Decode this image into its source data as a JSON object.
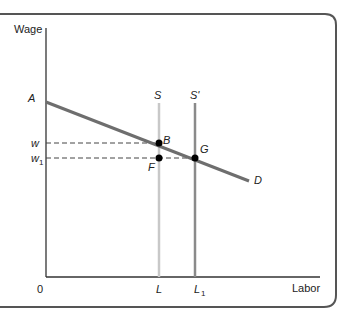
{
  "diagram": {
    "axes": {
      "y_label": "Wage",
      "x_label": "Labor",
      "origin_label": "0"
    },
    "y_ticks": {
      "A": "A",
      "w": "w",
      "w1_base": "w",
      "w1_sub": "1"
    },
    "x_ticks": {
      "L": "L",
      "L1_base": "L",
      "L1_sub": "1"
    },
    "curves": {
      "supply": "S",
      "supply_shifted": "S'",
      "demand": "D"
    },
    "points": {
      "B": "B",
      "G": "G",
      "F": "F"
    },
    "colors": {
      "frame": "#555555",
      "demand": "#6e6e6e",
      "supply": "#c8c8c8",
      "supply_shifted": "#8a8a8a",
      "axis": "#333333"
    }
  }
}
